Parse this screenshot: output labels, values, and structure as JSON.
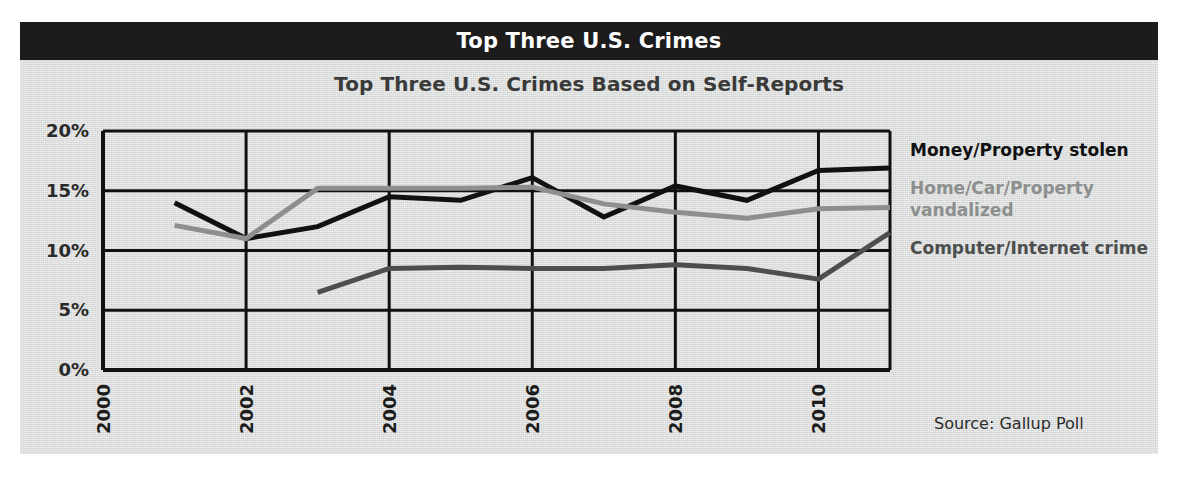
{
  "header": {
    "title": "Top Three U.S. Crimes",
    "bar_color": "#1c1c1c",
    "text_color": "#ffffff"
  },
  "subtitle": "Top Three U.S. Crimes Based on Self-Reports",
  "source_note": "Source: Gallup Poll",
  "legend": {
    "items": [
      {
        "label": "Money/Property stolen",
        "color": "#111111"
      },
      {
        "label": "Home/Car/Property vandalized",
        "color": "#8d8f8e"
      },
      {
        "label": "Computer/Internet crime",
        "color": "#4d4f4e"
      }
    ]
  },
  "chart_data": {
    "type": "line",
    "title": "Top Three U.S. Crimes Based on Self-Reports",
    "xlabel": "",
    "ylabel": "",
    "xlim": [
      2000,
      2011
    ],
    "ylim": [
      0,
      20
    ],
    "ytick_labels": [
      "0%",
      "5%",
      "10%",
      "15%",
      "20%"
    ],
    "yticks": [
      0,
      5,
      10,
      15,
      20
    ],
    "xtick_labels": [
      "2000",
      "2002",
      "2004",
      "2006",
      "2008",
      "2010"
    ],
    "xticks": [
      2000,
      2002,
      2004,
      2006,
      2008,
      2010
    ],
    "grid": true,
    "legend_position": "right",
    "series": [
      {
        "name": "Money/Property stolen",
        "color": "#111111",
        "x": [
          2001,
          2002,
          2003,
          2004,
          2005,
          2006,
          2007,
          2008,
          2009,
          2010,
          2011
        ],
        "values": [
          14.0,
          11.0,
          12.0,
          14.5,
          14.2,
          16.1,
          12.8,
          15.4,
          14.2,
          16.7,
          16.9
        ]
      },
      {
        "name": "Home/Car/Property vandalized",
        "color": "#8d8f8e",
        "x": [
          2001,
          2002,
          2003,
          2004,
          2005,
          2006,
          2007,
          2008,
          2009,
          2010,
          2011
        ],
        "values": [
          12.1,
          11.0,
          15.2,
          15.2,
          15.2,
          15.3,
          13.9,
          13.2,
          12.7,
          13.5,
          13.6
        ]
      },
      {
        "name": "Computer/Internet crime",
        "color": "#4d4f4e",
        "x": [
          2003,
          2004,
          2005,
          2006,
          2007,
          2008,
          2009,
          2010,
          2011
        ],
        "values": [
          6.5,
          8.5,
          8.6,
          8.5,
          8.5,
          8.8,
          8.5,
          7.6,
          11.5
        ]
      }
    ]
  }
}
